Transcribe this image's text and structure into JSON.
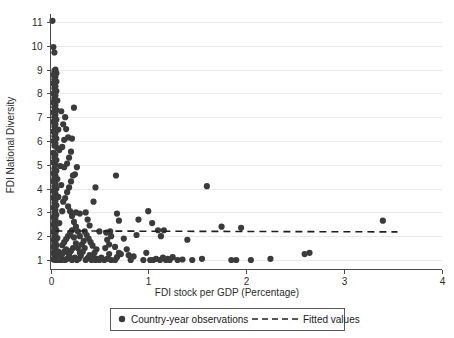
{
  "chart_data": {
    "type": "scatter",
    "title": "",
    "xlabel": "FDI stock per GDP (Percentage)",
    "ylabel": "FDI National Diversity",
    "xlim": [
      0,
      4
    ],
    "ylim": [
      0.6,
      11.4
    ],
    "xticks": [
      0,
      1,
      2,
      3,
      4
    ],
    "xtick_labels": [
      "0",
      "1",
      "2",
      "3",
      "4"
    ],
    "yticks": [
      1,
      2,
      3,
      4,
      5,
      6,
      7,
      8,
      9,
      10,
      11
    ],
    "ytick_labels": [
      "1",
      "2",
      "3",
      "4",
      "5",
      "6",
      "7",
      "8",
      "9",
      "10",
      "11"
    ],
    "grid": "horizontal",
    "legend_position": "below-axes",
    "series": [
      {
        "name": "Country-year observations",
        "marker": "circle",
        "color": "#3b3b3b",
        "points": [
          [
            0.02,
            11.05
          ],
          [
            0.03,
            9.95
          ],
          [
            0.04,
            9.72
          ],
          [
            0.05,
            9.0
          ],
          [
            0.04,
            8.95
          ],
          [
            0.06,
            8.85
          ],
          [
            0.03,
            8.78
          ],
          [
            0.05,
            8.7
          ],
          [
            0.04,
            8.6
          ],
          [
            0.06,
            8.5
          ],
          [
            0.03,
            8.42
          ],
          [
            0.05,
            8.3
          ],
          [
            0.04,
            8.22
          ],
          [
            0.06,
            8.1
          ],
          [
            0.03,
            8.0
          ],
          [
            0.05,
            7.92
          ],
          [
            0.04,
            7.8
          ],
          [
            0.07,
            7.7
          ],
          [
            0.03,
            7.62
          ],
          [
            0.05,
            7.5
          ],
          [
            0.04,
            7.42
          ],
          [
            0.06,
            7.3
          ],
          [
            0.03,
            7.2
          ],
          [
            0.05,
            7.1
          ],
          [
            0.04,
            7.0
          ],
          [
            0.06,
            6.9
          ],
          [
            0.03,
            6.8
          ],
          [
            0.05,
            6.7
          ],
          [
            0.04,
            6.6
          ],
          [
            0.08,
            6.48
          ],
          [
            0.03,
            6.4
          ],
          [
            0.05,
            6.3
          ],
          [
            0.04,
            6.2
          ],
          [
            0.06,
            6.1
          ],
          [
            0.03,
            6.0
          ],
          [
            0.05,
            5.9
          ],
          [
            0.04,
            5.8
          ],
          [
            0.07,
            5.7
          ],
          [
            0.09,
            5.62
          ],
          [
            0.03,
            5.5
          ],
          [
            0.05,
            5.42
          ],
          [
            0.04,
            5.3
          ],
          [
            0.06,
            5.2
          ],
          [
            0.03,
            5.1
          ],
          [
            0.05,
            5.0
          ],
          [
            0.1,
            4.95
          ],
          [
            0.14,
            4.9
          ],
          [
            0.04,
            4.85
          ],
          [
            0.06,
            4.75
          ],
          [
            0.03,
            4.65
          ],
          [
            0.05,
            4.55
          ],
          [
            0.04,
            4.45
          ],
          [
            0.07,
            4.4
          ],
          [
            0.03,
            4.3
          ],
          [
            0.05,
            4.2
          ],
          [
            0.11,
            4.15
          ],
          [
            0.04,
            4.1
          ],
          [
            0.06,
            4.0
          ],
          [
            0.03,
            3.9
          ],
          [
            0.05,
            3.8
          ],
          [
            0.04,
            3.7
          ],
          [
            0.08,
            3.65
          ],
          [
            0.03,
            3.6
          ],
          [
            0.05,
            3.5
          ],
          [
            0.04,
            3.4
          ],
          [
            0.06,
            3.3
          ],
          [
            0.03,
            3.2
          ],
          [
            0.05,
            3.1
          ],
          [
            0.12,
            3.05
          ],
          [
            0.04,
            3.0
          ],
          [
            0.06,
            2.9
          ],
          [
            0.03,
            2.8
          ],
          [
            0.05,
            2.72
          ],
          [
            0.04,
            2.62
          ],
          [
            0.09,
            2.55
          ],
          [
            0.03,
            2.48
          ],
          [
            0.05,
            2.4
          ],
          [
            0.04,
            2.32
          ],
          [
            0.06,
            2.25
          ],
          [
            0.03,
            2.18
          ],
          [
            0.05,
            2.1
          ],
          [
            0.04,
            2.0
          ],
          [
            0.07,
            1.92
          ],
          [
            0.03,
            1.85
          ],
          [
            0.05,
            1.78
          ],
          [
            0.04,
            1.7
          ],
          [
            0.06,
            1.62
          ],
          [
            0.03,
            1.55
          ],
          [
            0.05,
            1.48
          ],
          [
            0.04,
            1.4
          ],
          [
            0.08,
            1.35
          ],
          [
            0.03,
            1.28
          ],
          [
            0.05,
            1.2
          ],
          [
            0.04,
            1.12
          ],
          [
            0.06,
            1.06
          ],
          [
            0.03,
            1.02
          ],
          [
            0.05,
            1.0
          ],
          [
            0.07,
            1.0
          ],
          [
            0.09,
            1.0
          ],
          [
            0.11,
            1.0
          ],
          [
            0.13,
            1.02
          ],
          [
            0.15,
            1.0
          ],
          [
            0.17,
            1.05
          ],
          [
            0.1,
            1.15
          ],
          [
            0.12,
            1.25
          ],
          [
            0.14,
            1.35
          ],
          [
            0.16,
            1.45
          ],
          [
            0.18,
            1.3
          ],
          [
            0.2,
            1.1
          ],
          [
            0.22,
            1.0
          ],
          [
            0.19,
            1.22
          ],
          [
            0.21,
            1.38
          ],
          [
            0.23,
            1.5
          ],
          [
            0.12,
            1.62
          ],
          [
            0.14,
            1.75
          ],
          [
            0.16,
            1.88
          ],
          [
            0.18,
            2.0
          ],
          [
            0.2,
            2.12
          ],
          [
            0.22,
            2.25
          ],
          [
            0.24,
            1.95
          ],
          [
            0.26,
            1.7
          ],
          [
            0.28,
            1.5
          ],
          [
            0.3,
            1.3
          ],
          [
            0.25,
            1.1
          ],
          [
            0.27,
            1.0
          ],
          [
            0.29,
            1.05
          ],
          [
            0.31,
            1.18
          ],
          [
            0.33,
            1.35
          ],
          [
            0.35,
            1.5
          ],
          [
            0.32,
            1.65
          ],
          [
            0.34,
            1.8
          ],
          [
            0.3,
            2.0
          ],
          [
            0.28,
            2.2
          ],
          [
            0.26,
            2.4
          ],
          [
            0.24,
            2.6
          ],
          [
            0.22,
            2.85
          ],
          [
            0.2,
            3.05
          ],
          [
            0.18,
            3.25
          ],
          [
            0.26,
            3.0
          ],
          [
            0.3,
            2.95
          ],
          [
            0.13,
            3.45
          ],
          [
            0.15,
            3.6
          ],
          [
            0.17,
            3.85
          ],
          [
            0.19,
            4.05
          ],
          [
            0.21,
            4.3
          ],
          [
            0.23,
            4.55
          ],
          [
            0.25,
            4.6
          ],
          [
            0.27,
            4.9
          ],
          [
            0.17,
            5.05
          ],
          [
            0.19,
            5.3
          ],
          [
            0.21,
            5.55
          ],
          [
            0.12,
            5.75
          ],
          [
            0.14,
            6.05
          ],
          [
            0.16,
            6.5
          ],
          [
            0.18,
            6.15
          ],
          [
            0.22,
            6.1
          ],
          [
            0.24,
            7.4
          ],
          [
            0.13,
            6.7
          ],
          [
            0.15,
            7.0
          ],
          [
            0.11,
            7.25
          ],
          [
            0.36,
            1.0
          ],
          [
            0.38,
            1.08
          ],
          [
            0.4,
            1.2
          ],
          [
            0.42,
            1.0
          ],
          [
            0.44,
            1.12
          ],
          [
            0.46,
            1.0
          ],
          [
            0.48,
            1.05
          ],
          [
            0.5,
            1.0
          ],
          [
            0.52,
            1.1
          ],
          [
            0.45,
            1.3
          ],
          [
            0.47,
            1.45
          ],
          [
            0.43,
            1.6
          ],
          [
            0.41,
            1.75
          ],
          [
            0.39,
            1.9
          ],
          [
            0.37,
            2.05
          ],
          [
            0.35,
            2.2
          ],
          [
            0.5,
            2.2
          ],
          [
            0.4,
            2.45
          ],
          [
            0.38,
            2.7
          ],
          [
            0.36,
            3.0
          ],
          [
            0.44,
            3.45
          ],
          [
            0.46,
            4.05
          ],
          [
            0.55,
            1.0
          ],
          [
            0.58,
            1.05
          ],
          [
            0.6,
            1.25
          ],
          [
            0.62,
            1.0
          ],
          [
            0.56,
            1.5
          ],
          [
            0.6,
            1.65
          ],
          [
            0.58,
            1.85
          ],
          [
            0.62,
            2.0
          ],
          [
            0.57,
            2.15
          ],
          [
            0.61,
            2.2
          ],
          [
            0.66,
            1.0
          ],
          [
            0.68,
            1.12
          ],
          [
            0.7,
            1.3
          ],
          [
            0.66,
            1.55
          ],
          [
            0.72,
            1.25
          ],
          [
            0.7,
            2.65
          ],
          [
            0.68,
            2.95
          ],
          [
            0.67,
            4.55
          ],
          [
            0.75,
            1.9
          ],
          [
            0.78,
            1.45
          ],
          [
            0.8,
            1.2
          ],
          [
            0.82,
            1.0
          ],
          [
            0.85,
            1.15
          ],
          [
            0.88,
            2.05
          ],
          [
            0.9,
            2.7
          ],
          [
            0.95,
            1.0
          ],
          [
            0.98,
            1.3
          ],
          [
            1.02,
            1.0
          ],
          [
            1.05,
            1.0
          ],
          [
            1.08,
            1.05
          ],
          [
            1.12,
            1.0
          ],
          [
            1.15,
            1.1
          ],
          [
            1.18,
            1.0
          ],
          [
            1.2,
            1.05
          ],
          [
            1.22,
            1.0
          ],
          [
            1.25,
            1.12
          ],
          [
            1.1,
            2.25
          ],
          [
            1.13,
            2.0
          ],
          [
            1.16,
            2.25
          ],
          [
            1.0,
            3.05
          ],
          [
            1.04,
            2.55
          ],
          [
            1.3,
            1.0
          ],
          [
            1.35,
            1.02
          ],
          [
            1.4,
            1.85
          ],
          [
            1.45,
            1.0
          ],
          [
            1.55,
            1.05
          ],
          [
            1.6,
            4.1
          ],
          [
            1.75,
            2.4
          ],
          [
            1.85,
            1.0
          ],
          [
            1.9,
            1.0
          ],
          [
            1.95,
            2.35
          ],
          [
            2.05,
            1.0
          ],
          [
            2.25,
            1.05
          ],
          [
            2.6,
            1.25
          ],
          [
            2.65,
            1.3
          ],
          [
            3.4,
            2.65
          ]
        ]
      }
    ],
    "fit": {
      "name": "Fitted values",
      "style": "dashed",
      "color": "#1f1f1f",
      "x_start": 0.05,
      "x_end": 3.55,
      "y_start": 2.22,
      "y_end": 2.18
    }
  },
  "legend": {
    "marker_label": "Country-year observations",
    "line_label": "Fitted values"
  },
  "colors": {
    "point": "#3b3b3b",
    "fitline": "#1f1f1f",
    "axis": "#4a4a4a",
    "grid": "#e9e9e9",
    "background": "#ffffff"
  }
}
